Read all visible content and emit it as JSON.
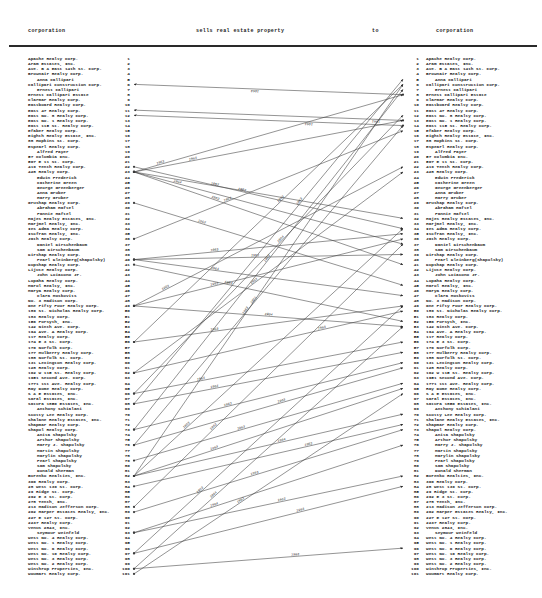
{
  "header": {
    "left_label": "corporation",
    "action_label": "sells real estate property",
    "to_label": "to",
    "right_label": "corporation"
  },
  "colors": {
    "ink": "#1c1c1c",
    "line": "#3a3a3a",
    "paper": "#ffffff"
  },
  "corporations": [
    {
      "n": 1,
      "name": "Apache Realty Corp.",
      "person": false
    },
    {
      "n": 2,
      "name": "Aram Estates, Inc.",
      "person": false
    },
    {
      "n": 3,
      "name": "Ave. B & East 14th St. Corp.",
      "person": false
    },
    {
      "n": 4,
      "name": "Brownair Realty Corp.",
      "person": false
    },
    {
      "n": 5,
      "name": "Anna Callipari",
      "person": true
    },
    {
      "n": 6,
      "name": "Callipari Construction Corp.",
      "person": false
    },
    {
      "n": 7,
      "name": "Ernest Callipari",
      "person": true
    },
    {
      "n": 8,
      "name": "Ernest Callipari Estate",
      "person": false
    },
    {
      "n": 9,
      "name": "Clarmar Realty Corp.",
      "person": false
    },
    {
      "n": 10,
      "name": "Eastboard Realty Corp.",
      "person": false
    },
    {
      "n": 11,
      "name": "East 47 Realty Corp.",
      "person": false
    },
    {
      "n": 12,
      "name": "East No. 8 Realty Corp.",
      "person": false
    },
    {
      "n": 13,
      "name": "East No. 1 Realty Corp.",
      "person": false
    },
    {
      "n": 14,
      "name": "East 115 St. Realty Corp.",
      "person": false
    },
    {
      "n": 15,
      "name": "Efaber Realty Corp.",
      "person": false
    },
    {
      "n": 16,
      "name": "Eighth Realty Estate, Inc.",
      "person": false
    },
    {
      "n": 17,
      "name": "88 Hopkins St. Corp.",
      "person": false
    },
    {
      "n": 18,
      "name": "Espearl Realty Corp.",
      "person": false
    },
    {
      "n": 19,
      "name": "Alfred Fayer",
      "person": true
    },
    {
      "n": 20,
      "name": "57 Columbia Inc.",
      "person": false
    },
    {
      "n": 21,
      "name": "507 E 11 St. Corp.",
      "person": false
    },
    {
      "n": 22,
      "name": "419 Tenth Realty Corp.",
      "person": false
    },
    {
      "n": 23,
      "name": "428 Realty Corp.",
      "person": false
    },
    {
      "n": 24,
      "name": "Edwin Frederick",
      "person": true
    },
    {
      "n": 25,
      "name": "Catherine Green",
      "person": true
    },
    {
      "n": 26,
      "name": "George Greenberger",
      "person": true
    },
    {
      "n": 27,
      "name": "Anna Gruber",
      "person": true
    },
    {
      "n": 28,
      "name": "Harry Gruber",
      "person": true
    },
    {
      "n": 29,
      "name": "Grushap Realty Corp.",
      "person": false
    },
    {
      "n": 30,
      "name": "Abraham Haftel",
      "person": true
    },
    {
      "n": 31,
      "name": "Fannie Haftel",
      "person": true
    },
    {
      "n": 32,
      "name": "Hajes Realty Estates, Inc.",
      "person": false
    },
    {
      "n": 33,
      "name": "Harjmel Realty, Inc.",
      "person": false
    },
    {
      "n": 34,
      "name": "Ies Adma Realty Corp.",
      "person": false
    },
    {
      "n": 35,
      "name": "Iscfran Realty, Inc.",
      "person": false
    },
    {
      "n": 36,
      "name": "Jath Realty Corp.",
      "person": false
    },
    {
      "n": 37,
      "name": "Daniel Kirschenbaum",
      "person": true
    },
    {
      "n": 38,
      "name": "Sam Kirschenbaum",
      "person": true
    },
    {
      "n": 39,
      "name": "Kirshap Realty Corp.",
      "person": false
    },
    {
      "n": 40,
      "name": "Pearl Kleinberg(Shapolsky)",
      "person": true
    },
    {
      "n": 41,
      "name": "Kupshap Realty Corp.",
      "person": false
    },
    {
      "n": 42,
      "name": "Lijute Realty Corp.",
      "person": false
    },
    {
      "n": 43,
      "name": "John Loiacono Jr.",
      "person": true
    },
    {
      "n": 44,
      "name": "Lopaha Realty Corp.",
      "person": false
    },
    {
      "n": 45,
      "name": "Marol Realty, Inc.",
      "person": false
    },
    {
      "n": 46,
      "name": "Marya Realty Corp.",
      "person": false
    },
    {
      "n": 47,
      "name": "Clara Moskovits",
      "person": true
    },
    {
      "n": 48,
      "name": "No. 3 Madison Corp.",
      "person": false
    },
    {
      "n": 49,
      "name": "One Fifty Four Realty Corp.",
      "person": false
    },
    {
      "n": 50,
      "name": "189 St. Nicholas Realty Corp.",
      "person": false
    },
    {
      "n": 51,
      "name": "183 Realty Corp.",
      "person": false
    },
    {
      "n": 52,
      "name": "156 Forsyth, Inc.",
      "person": false
    },
    {
      "n": 53,
      "name": "142 Ninth Ave. Corp.",
      "person": false
    },
    {
      "n": 54,
      "name": "194 Ave. A Realty Corp.",
      "person": false
    },
    {
      "n": 55,
      "name": "117 Realty Corp.",
      "person": false
    },
    {
      "n": 56,
      "name": "174 E 3 St. Corp.",
      "person": false
    },
    {
      "n": 57,
      "name": "170 Norfolk Corp.",
      "person": false
    },
    {
      "n": 58,
      "name": "177 Mulberry Realty Corp.",
      "person": false
    },
    {
      "n": 59,
      "name": "188 Norfolk St. Corp.",
      "person": false
    },
    {
      "n": 60,
      "name": "131 Lexington Realty Corp.",
      "person": false
    },
    {
      "n": 61,
      "name": "128 Realty Corp.",
      "person": false
    },
    {
      "n": 62,
      "name": "102 W 115 St. Realty Corp.",
      "person": false
    },
    {
      "n": 63,
      "name": "1951 Second Ave. Corp.",
      "person": false
    },
    {
      "n": 64,
      "name": "1771 1st Ave. Realty Corp.",
      "person": false
    },
    {
      "n": 65,
      "name": "Ray Dome Realty Corp.",
      "person": false
    },
    {
      "n": 66,
      "name": "S & E Estates, Inc.",
      "person": false
    },
    {
      "n": 67,
      "name": "Saral Estates, Inc.",
      "person": false
    },
    {
      "n": 68,
      "name": "Satura 1850 Estates, Inc.",
      "person": false
    },
    {
      "n": 69,
      "name": "Anthony Schialani",
      "person": true
    },
    {
      "n": 70,
      "name": "Scotty Lee Realty Corp.",
      "person": false
    },
    {
      "n": 71,
      "name": "Shalane Realty Estates, Inc.",
      "person": false
    },
    {
      "n": 72,
      "name": "Shapmar Realty Corp.",
      "person": false
    },
    {
      "n": 73,
      "name": "Shapol Realty Corp.",
      "person": false
    },
    {
      "n": 74,
      "name": "Anita Shapolsky",
      "person": true
    },
    {
      "n": 75,
      "name": "Arthur Shapolsky",
      "person": true
    },
    {
      "n": 76,
      "name": "Harry J. Shapolsky",
      "person": true
    },
    {
      "n": 77,
      "name": "Martin Shapolsky",
      "person": true
    },
    {
      "n": 78,
      "name": "Marylin Shapolsky",
      "person": true
    },
    {
      "n": 79,
      "name": "Pearl Shapolsky",
      "person": true
    },
    {
      "n": 80,
      "name": "Sam Shapolsky",
      "person": true
    },
    {
      "n": 81,
      "name": "Donald Sherman",
      "person": true
    },
    {
      "n": 82,
      "name": "Burenko Realties, Inc.",
      "person": false
    },
    {
      "n": 83,
      "name": "300 Realty Corp.",
      "person": false
    },
    {
      "n": 84,
      "name": "28 West 139 St. Corp.",
      "person": false
    },
    {
      "n": 85,
      "name": "29 Ridge St. Corp.",
      "person": false
    },
    {
      "n": 86,
      "name": "292 E 3 St. Corp.",
      "person": false
    },
    {
      "n": 87,
      "name": "278 Tenth, Inc.",
      "person": false
    },
    {
      "n": 88,
      "name": "213 Madison Jefferson Corp.",
      "person": false
    },
    {
      "n": 89,
      "name": "202 Harper Estates Realty, Inc.",
      "person": false
    },
    {
      "n": 90,
      "name": "227 E 127 St. Corp.",
      "person": false
    },
    {
      "n": 91,
      "name": "2237 Realty Corp.",
      "person": false
    },
    {
      "n": 92,
      "name": "Venus 2843, Inc.",
      "person": false
    },
    {
      "n": 93,
      "name": "Seymour Weinfeld",
      "person": true
    },
    {
      "n": 94,
      "name": "West No. 4 Realty Corp.",
      "person": false
    },
    {
      "n": 95,
      "name": "West No. 1 Realty Corp.",
      "person": false
    },
    {
      "n": 96,
      "name": "West No. 6 Realty Corp.",
      "person": false
    },
    {
      "n": 97,
      "name": "West No. 10 Realty Corp.",
      "person": false
    },
    {
      "n": 98,
      "name": "West No. 3 Realty Corp.",
      "person": false
    },
    {
      "n": 99,
      "name": "West No. 2 Realty Corp.",
      "person": false
    },
    {
      "n": 100,
      "name": "Winthrop Properties, Inc.",
      "person": false
    },
    {
      "n": 101,
      "name": "Woumart Realty Corp.",
      "person": false
    }
  ],
  "transfers": [
    {
      "left": 6,
      "right": 8,
      "arrow": "left",
      "year": "1963",
      "t": 0.55
    },
    {
      "left": 11,
      "right": 13,
      "arrow": "left",
      "year": "1961",
      "t": 0.1
    },
    {
      "left": 12,
      "right": 14,
      "arrow": "left",
      "year": "1961",
      "t": 0.35
    },
    {
      "left": 23,
      "right": 8,
      "arrow": "right",
      "year": "1963",
      "t": 0.1
    },
    {
      "left": 23,
      "right": 13,
      "arrow": "right",
      "year": "1963",
      "t": 0.22
    },
    {
      "left": 23,
      "right": 32,
      "arrow": "right",
      "year": "1963",
      "t": 0.3
    },
    {
      "left": 23,
      "right": 37,
      "arrow": "right",
      "year": "1964",
      "t": 0.16
    },
    {
      "left": 23,
      "right": 41,
      "arrow": "right",
      "year": "1963",
      "t": 0.3
    },
    {
      "left": 22,
      "right": 34,
      "arrow": "right",
      "year": "1963",
      "t": 0.4
    },
    {
      "left": 29,
      "right": 45,
      "arrow": "right",
      "year": "1963",
      "t": 0.25
    },
    {
      "left": 36,
      "right": 15,
      "arrow": "right",
      "year": "1963",
      "t": 0.35
    },
    {
      "left": 40,
      "right": 35,
      "arrow": "right",
      "year": "1963",
      "t": 0.3
    },
    {
      "left": 40,
      "right": 39,
      "arrow": "right",
      "year": "1963",
      "t": 0.45
    },
    {
      "left": 40,
      "right": 47,
      "arrow": "right",
      "year": "1964",
      "t": 0.3
    },
    {
      "left": 41,
      "right": 52,
      "arrow": "right",
      "year": "1963",
      "t": 0.35
    },
    {
      "left": 49,
      "right": 22,
      "arrow": "right",
      "year": "1963",
      "t": 0.12
    },
    {
      "left": 49,
      "right": 36,
      "arrow": "right",
      "year": "1963",
      "t": 0.3
    },
    {
      "left": 49,
      "right": 53,
      "arrow": "right",
      "year": "1964",
      "t": 0.5
    },
    {
      "left": 56,
      "right": 6,
      "arrow": "right",
      "year": "1963",
      "t": 0.55
    },
    {
      "left": 56,
      "right": 49,
      "arrow": "right",
      "year": "1963",
      "t": 0.3
    },
    {
      "left": 62,
      "right": 23,
      "arrow": "right",
      "year": "1963",
      "t": 0.45
    },
    {
      "left": 62,
      "right": 50,
      "arrow": "right",
      "year": "1963",
      "t": 0.7
    },
    {
      "left": 66,
      "right": 12,
      "arrow": "right",
      "year": "1964",
      "t": 0.55
    },
    {
      "left": 66,
      "right": 56,
      "arrow": "right",
      "year": "1963",
      "t": 0.25
    },
    {
      "left": 68,
      "right": 5,
      "arrow": "right",
      "year": "1963",
      "t": 0.62
    },
    {
      "left": 68,
      "right": 58,
      "arrow": "right",
      "year": "1964",
      "t": 0.3
    },
    {
      "left": 73,
      "right": 7,
      "arrow": "right",
      "year": "1963",
      "t": 0.5
    },
    {
      "left": 73,
      "right": 60,
      "arrow": "right",
      "year": "1963",
      "t": 0.35
    },
    {
      "left": 76,
      "right": 14,
      "arrow": "right",
      "year": "1951",
      "t": 0.45
    },
    {
      "left": 76,
      "right": 61,
      "arrow": "right",
      "year": "1963",
      "t": 0.55
    },
    {
      "left": 79,
      "right": 64,
      "arrow": "right",
      "year": "1963",
      "t": 0.4
    },
    {
      "left": 82,
      "right": 6,
      "arrow": "right",
      "year": "1963",
      "t": 0.42
    },
    {
      "left": 82,
      "right": 34,
      "arrow": "right",
      "year": "1963",
      "t": 0.2
    },
    {
      "left": 82,
      "right": 65,
      "arrow": "right",
      "year": "1963",
      "t": 0.3
    },
    {
      "left": 82,
      "right": 70,
      "arrow": "right",
      "year": "1964",
      "t": 0.55
    },
    {
      "left": 84,
      "right": 72,
      "arrow": "right",
      "year": "1963",
      "t": 0.65
    },
    {
      "left": 88,
      "right": 37,
      "arrow": "right",
      "year": "1963",
      "t": 0.3
    },
    {
      "left": 89,
      "right": 73,
      "arrow": "right",
      "year": "1963",
      "t": 0.45
    },
    {
      "left": 93,
      "right": 76,
      "arrow": "right",
      "year": "1964",
      "t": 0.3
    },
    {
      "left": 93,
      "right": 82,
      "arrow": "right",
      "year": "1963",
      "t": 0.55
    },
    {
      "left": 97,
      "right": 49,
      "arrow": "right",
      "year": "1963",
      "t": 0.25
    },
    {
      "left": 97,
      "right": 84,
      "arrow": "right",
      "year": "1963",
      "t": 0.62
    },
    {
      "left": 100,
      "right": 53,
      "arrow": "right",
      "year": "1964",
      "t": 0.3
    },
    {
      "left": 100,
      "right": 96,
      "arrow": "right",
      "year": "1963",
      "t": 0.6
    },
    {
      "left": 101,
      "right": 66,
      "arrow": "right",
      "year": "1963",
      "t": 0.4
    }
  ],
  "layout_note": "left corporation list sells property (lines with year labels) to right corporation list"
}
